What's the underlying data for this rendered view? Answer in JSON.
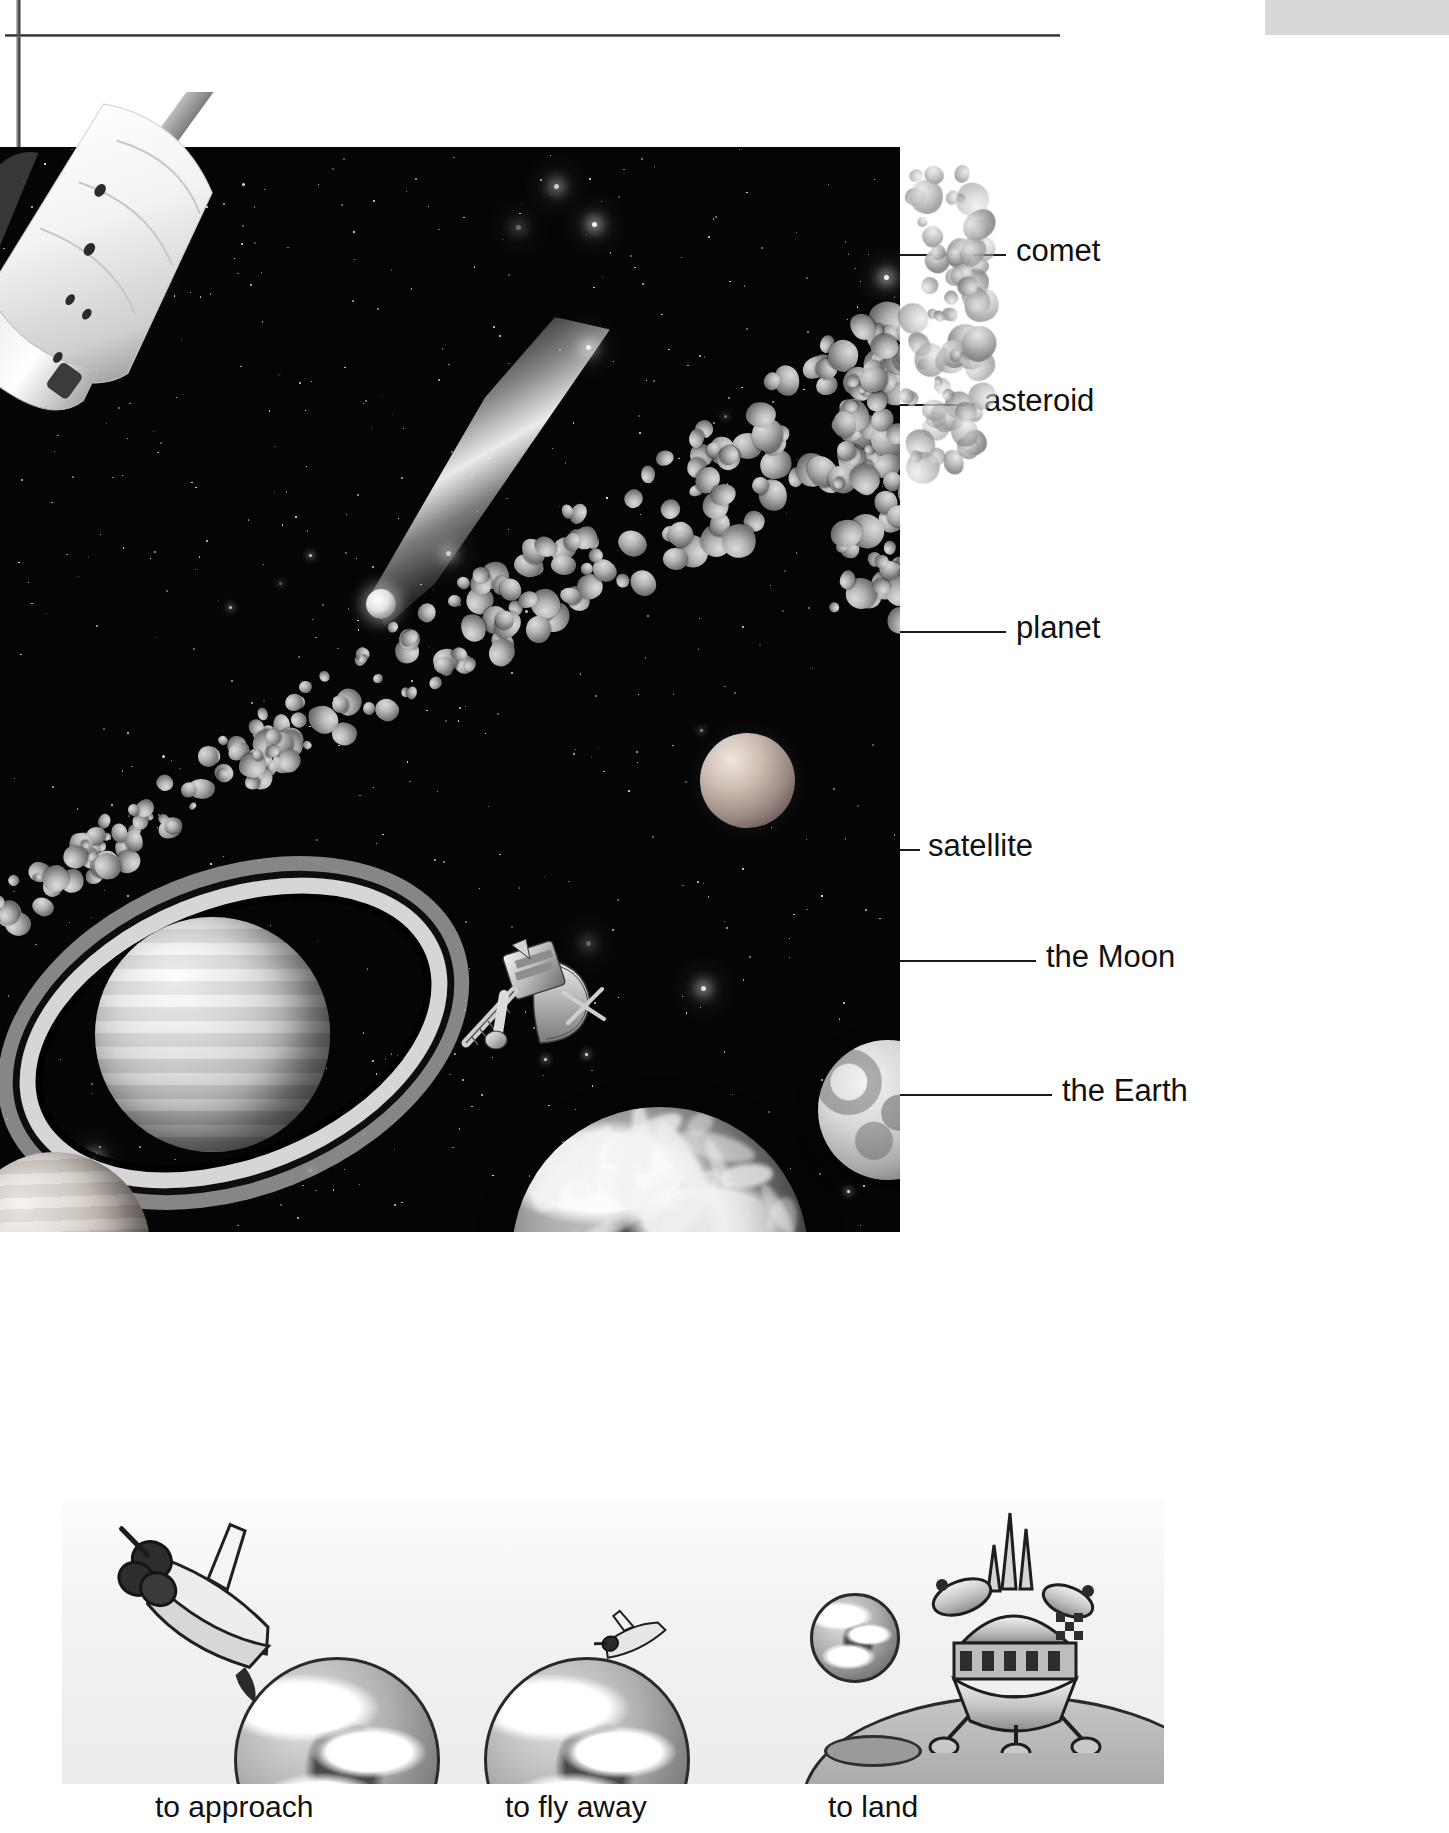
{
  "page": {
    "kind": "illustrated-dictionary-page",
    "topic": "space"
  },
  "diagram": {
    "labels": [
      {
        "id": "comet",
        "text": "comet",
        "line_y": 254,
        "text_x": 1016,
        "leader_from_x": 900,
        "leader_to_x": 1006
      },
      {
        "id": "asteroid",
        "text": "asteroid",
        "line_y": 404,
        "text_x": 984,
        "leader_from_x": 900,
        "leader_to_x": 974
      },
      {
        "id": "planet",
        "text": "planet",
        "line_y": 631,
        "text_x": 1016,
        "leader_from_x": 900,
        "leader_to_x": 1006
      },
      {
        "id": "satellite",
        "text": "satellite",
        "line_y": 849,
        "text_x": 928,
        "leader_from_x": 900,
        "leader_to_x": 920
      },
      {
        "id": "the-moon",
        "text": "the Moon",
        "line_y": 960,
        "text_x": 1046,
        "leader_from_x": 900,
        "leader_to_x": 1036
      },
      {
        "id": "the-earth",
        "text": "the Earth",
        "line_y": 1094,
        "text_x": 1062,
        "leader_from_x": 900,
        "leader_to_x": 1052
      }
    ],
    "objects": [
      {
        "id": "space-shuttle",
        "name": "space shuttle"
      },
      {
        "id": "comet",
        "name": "comet"
      },
      {
        "id": "asteroid-belt",
        "name": "asteroid belt"
      },
      {
        "id": "planet",
        "name": "planet"
      },
      {
        "id": "ringed-planet",
        "name": "ringed planet"
      },
      {
        "id": "satellite",
        "name": "satellite"
      },
      {
        "id": "the-moon",
        "name": "the Moon"
      },
      {
        "id": "the-earth",
        "name": "the Earth"
      }
    ]
  },
  "verb_strip": {
    "items": [
      {
        "id": "to-approach",
        "caption": "to approach",
        "caption_x": 155,
        "cell_x": 0
      },
      {
        "id": "to-fly-away",
        "caption": "to fly away",
        "caption_x": 505,
        "cell_x": 360
      },
      {
        "id": "to-land",
        "caption": "to land",
        "caption_x": 828,
        "cell_x": 700
      }
    ],
    "caption_y": 1790
  },
  "colors": {
    "space_background": "#050508",
    "page_background": "#ffffff",
    "label_text": "#111111",
    "leader_line": "#1a1a1a",
    "strip_background": "#f1f1f1",
    "corner_swatch": "#d8d8d8"
  }
}
